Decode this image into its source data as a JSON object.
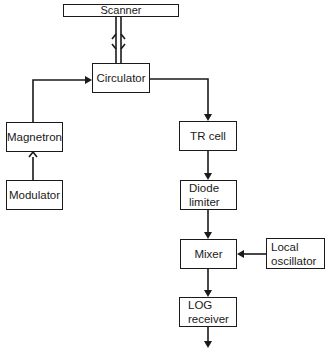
{
  "diagram": {
    "type": "block-diagram",
    "nodes": {
      "scanner": {
        "label": "Scanner"
      },
      "circulator": {
        "label": "Circulator"
      },
      "magnetron": {
        "label": "Magnetron"
      },
      "modulator": {
        "label": "Modulator"
      },
      "tr_cell": {
        "label": "TR cell"
      },
      "diode_limiter": {
        "label_line1": "Diode",
        "label_line2": "limiter"
      },
      "mixer": {
        "label": "Mixer"
      },
      "local_oscillator": {
        "label_line1": "Local",
        "label_line2": "oscillator"
      },
      "log_receiver": {
        "label_line1": "LOG",
        "label_line2": "receiver"
      }
    },
    "edges": [
      {
        "from": "scanner",
        "to": "circulator",
        "style": "bidirectional-waveguide"
      },
      {
        "from": "modulator",
        "to": "magnetron"
      },
      {
        "from": "magnetron",
        "to": "circulator"
      },
      {
        "from": "circulator",
        "to": "tr_cell"
      },
      {
        "from": "tr_cell",
        "to": "diode_limiter"
      },
      {
        "from": "diode_limiter",
        "to": "mixer"
      },
      {
        "from": "local_oscillator",
        "to": "mixer"
      },
      {
        "from": "mixer",
        "to": "log_receiver"
      },
      {
        "from": "log_receiver",
        "to": "output"
      }
    ],
    "colors": {
      "stroke": "#1a1a1a",
      "background": "#ffffff"
    }
  }
}
